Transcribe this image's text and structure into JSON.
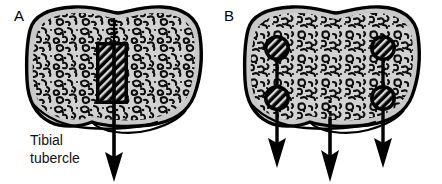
{
  "figure": {
    "background_color": "#ffffff",
    "width": 442,
    "height": 184,
    "panels": [
      {
        "id": "A",
        "letter": "A",
        "letter_x": 14,
        "letter_y": 20,
        "description": "Axial section of proximal tibia with single central block fixation and one downward force arrow",
        "bone": {
          "outline_color": "#000000",
          "fill_color": "#c9c9c9",
          "interior_color": "#d2d2d2",
          "outline_width": 3.2,
          "cx": 112,
          "feature_label": "Tibial tubercle"
        },
        "implants": [
          {
            "type": "block-graft",
            "shape": "rectangle",
            "x": 96,
            "y": 42,
            "width": 32,
            "height": 62,
            "fill": "#000000",
            "hatch": true
          }
        ],
        "arrows": [
          {
            "name": "central-force-arrow",
            "x": 114,
            "top_y": 18,
            "tip_y": 180,
            "threaded_top": true,
            "color": "#000000"
          }
        ],
        "annotations": [
          {
            "name": "tibial-tubercle-label",
            "lines": [
              "Tibial",
              "tubercle"
            ],
            "x": 30,
            "y": 142
          }
        ]
      },
      {
        "id": "B",
        "letter": "B",
        "letter_x": 224,
        "letter_y": 20,
        "description": "Axial section of proximal tibia with two pairs of screws in cross-section and three downward force arrows",
        "bone": {
          "outline_color": "#000000",
          "fill_color": "#c9c9c9",
          "interior_color": "#d2d2d2",
          "outline_width": 3.2,
          "cx": 330
        },
        "implants": [
          {
            "type": "screw-cross-section",
            "shape": "circle",
            "cx": 277,
            "cy": 48,
            "r": 13,
            "fill": "#000000",
            "hatch": true
          },
          {
            "type": "screw-cross-section",
            "shape": "circle",
            "cx": 277,
            "cy": 98,
            "r": 13,
            "fill": "#000000",
            "hatch": true
          },
          {
            "type": "screw-cross-section",
            "shape": "circle",
            "cx": 383,
            "cy": 48,
            "r": 13,
            "fill": "#000000",
            "hatch": true
          },
          {
            "type": "screw-cross-section",
            "shape": "circle",
            "cx": 383,
            "cy": 98,
            "r": 13,
            "fill": "#000000",
            "hatch": true
          }
        ],
        "arrows": [
          {
            "name": "left-force-arrow",
            "x": 277,
            "top_y": 48,
            "tip_y": 166,
            "threaded_top": false,
            "color": "#000000"
          },
          {
            "name": "center-force-arrow",
            "x": 330,
            "top_y": 102,
            "tip_y": 182,
            "threaded_top": true,
            "color": "#000000"
          },
          {
            "name": "right-force-arrow",
            "x": 383,
            "top_y": 48,
            "tip_y": 166,
            "threaded_top": false,
            "color": "#000000"
          }
        ],
        "annotations": []
      }
    ],
    "legend_note": ""
  }
}
